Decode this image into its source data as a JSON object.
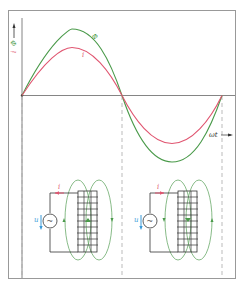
{
  "figure": {
    "y_axis_label": "Φ, i",
    "y_axis_label_phi": "Φ",
    "y_axis_label_i": "i",
    "x_axis_label": "ωt",
    "curve_phi_label": "Φ",
    "curve_i_label": "i",
    "colors": {
      "phi": "#4a9a4a",
      "current": "#e05570",
      "voltage": "#3a9ad8",
      "axis": "#666666",
      "frame": "#999999",
      "dashed": "#aaaaaa",
      "field": "#6aaa6a"
    }
  },
  "circuits": [
    {
      "current_label": "i",
      "voltage_label": "u",
      "source_symbol": "~"
    },
    {
      "current_label": "i",
      "voltage_label": "u",
      "source_symbol": "~"
    }
  ]
}
